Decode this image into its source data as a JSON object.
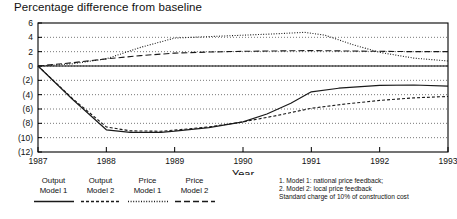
{
  "chart_data": {
    "type": "line",
    "title": "Percentage difference from baseline",
    "xlabel": "Year",
    "ylabel": "",
    "x": [
      1987,
      1988,
      1989,
      1990,
      1991,
      1992,
      1993
    ],
    "xlim": [
      1987,
      1993
    ],
    "ylim": [
      -12,
      6
    ],
    "yticks": [
      6,
      4,
      2,
      0,
      -2,
      -4,
      -6,
      -8,
      -10,
      -12
    ],
    "ytick_labels": [
      "6",
      "4",
      "2",
      "0",
      "(2)",
      "(4)",
      "(6)",
      "(8)",
      "(10)",
      "(12)"
    ],
    "xtick_labels": [
      "1987",
      "1988",
      "1989",
      "1990",
      "1991",
      "1992",
      "1993"
    ],
    "grid": true,
    "legend_position": "below-left",
    "series": [
      {
        "name": "Output Model 1",
        "style": "solid",
        "x": [
          1987.0,
          1987.5,
          1988.0,
          1988.35,
          1988.8,
          1989.0,
          1989.5,
          1990.0,
          1990.35,
          1990.7,
          1991.0,
          1991.4,
          1992.0,
          1992.5,
          1993.0
        ],
        "values": [
          0.0,
          -4.6,
          -8.9,
          -9.25,
          -9.25,
          -9.1,
          -8.6,
          -7.8,
          -6.7,
          -5.2,
          -3.6,
          -3.1,
          -2.7,
          -2.65,
          -2.8
        ]
      },
      {
        "name": "Output Model 2",
        "style": "short-dash",
        "x": [
          1987.0,
          1987.5,
          1988.0,
          1988.35,
          1988.8,
          1989.0,
          1989.5,
          1990.0,
          1990.5,
          1991.0,
          1991.5,
          1992.0,
          1992.5,
          1993.0
        ],
        "values": [
          0.0,
          -4.5,
          -8.5,
          -9.05,
          -9.1,
          -8.95,
          -8.5,
          -7.8,
          -6.9,
          -5.9,
          -5.3,
          -4.8,
          -4.45,
          -4.25
        ]
      },
      {
        "name": "Price Model 1",
        "style": "dotted",
        "x": [
          1987.0,
          1987.5,
          1988.0,
          1988.5,
          1989.0,
          1989.5,
          1990.0,
          1990.5,
          1990.9,
          1991.2,
          1991.6,
          1992.0,
          1992.5,
          1993.0
        ],
        "values": [
          0.0,
          0.3,
          1.0,
          2.6,
          3.9,
          4.1,
          4.3,
          4.5,
          4.7,
          4.3,
          3.0,
          1.9,
          1.1,
          0.7
        ]
      },
      {
        "name": "Price Model 2",
        "style": "long-dash",
        "x": [
          1987.0,
          1987.5,
          1988.0,
          1988.5,
          1989.0,
          1989.5,
          1990.0,
          1990.5,
          1991.0,
          1991.5,
          1992.0,
          1992.5,
          1993.0
        ],
        "values": [
          0.0,
          0.45,
          1.0,
          1.45,
          1.8,
          1.95,
          2.05,
          2.1,
          2.15,
          2.1,
          2.05,
          2.0,
          2.0
        ]
      }
    ]
  },
  "legend": {
    "items": [
      {
        "line1": "Output",
        "line2": "Model 1",
        "style": "solid"
      },
      {
        "line1": "Output",
        "line2": "Model 2",
        "style": "short-dash"
      },
      {
        "line1": "Price",
        "line2": "Model 1",
        "style": "dotted"
      },
      {
        "line1": "Price",
        "line2": "Model 2",
        "style": "long-dash"
      }
    ]
  },
  "notes": {
    "line1": "1. Model 1: national price feedback;",
    "line2": "2. Model 2: local price feedback",
    "line3": "Standard charge of 10% of construction cost"
  },
  "colors": {
    "line": "#1a1a1a",
    "grid": "#555555",
    "axis": "#000000",
    "text": "#111111"
  }
}
